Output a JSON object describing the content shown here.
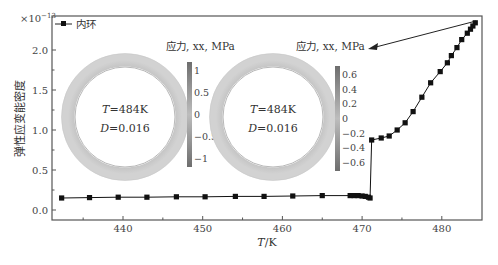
{
  "chart_data": {
    "type": "line",
    "title": "",
    "xlabel": "T/K",
    "ylabel": "弹性应变能密度",
    "y_multiplier": "×10⁻¹³",
    "xlim": [
      431,
      485
    ],
    "ylim": [
      -0.05,
      2.35
    ],
    "xticks": [
      440,
      450,
      460,
      470,
      480
    ],
    "yticks": [
      0.0,
      0.5,
      1.0,
      1.5,
      2.0
    ],
    "xtick_labels": [
      "440",
      "450",
      "460",
      "470",
      "480"
    ],
    "ytick_labels": [
      "0.0",
      "0.5",
      "1.0",
      "1.5",
      "2.0"
    ],
    "grid": false,
    "legend_position": "upper-left",
    "series": [
      {
        "name": "内环",
        "marker": "square",
        "color": "#111111",
        "x": [
          432.3,
          435.8,
          439.4,
          443.0,
          446.7,
          450.3,
          454.1,
          457.7,
          461.3,
          465.0,
          468.5,
          469.0,
          469.5,
          470.0,
          470.4,
          470.8,
          471.0,
          471.2,
          472.4,
          473.4,
          474.4,
          475.4,
          476.4,
          477.5,
          478.6,
          479.8,
          480.7,
          481.2,
          481.9,
          482.5,
          483.2,
          483.6,
          483.9,
          484.2
        ],
        "y": [
          0.15,
          0.155,
          0.16,
          0.16,
          0.165,
          0.165,
          0.17,
          0.17,
          0.175,
          0.18,
          0.18,
          0.18,
          0.18,
          0.175,
          0.17,
          0.16,
          0.15,
          0.875,
          0.9,
          0.925,
          1.0,
          1.09,
          1.23,
          1.41,
          1.59,
          1.73,
          1.84,
          1.93,
          2.03,
          2.13,
          2.21,
          2.26,
          2.3,
          2.34
        ]
      }
    ],
    "annotations": [
      {
        "text": "应力, xx, MPa",
        "arrow_from": [
          484.2,
          2.34
        ],
        "arrow_to": "right-inset-colorbar-title"
      }
    ],
    "insets": [
      {
        "name": "left-ring",
        "colorbar_title": "应力, xx, MPa",
        "colorbar_ticks": [
          "1",
          "0.5",
          "0",
          "−0.5",
          "−1"
        ],
        "temperature_label": "T = 484K",
        "damage_label": "D = 0.016"
      },
      {
        "name": "right-ring",
        "colorbar_title": "应力, xx, MPa",
        "colorbar_ticks": [
          "0.6",
          "0.4",
          "0.2",
          "0",
          "−0.2",
          "−0.4",
          "−0.6"
        ],
        "temperature_label": "T = 484K",
        "damage_label": "D = 0.016"
      }
    ]
  },
  "axes": {
    "xlabel_italic": "T",
    "xlabel_rest": "/K",
    "ylabel": "弹性应变能密度",
    "multiplier": "×10",
    "multiplier_exp": "−13"
  },
  "legend": {
    "label": "内环"
  },
  "insets": {
    "left": {
      "title": "应力, xx, MPa",
      "t_var": "T",
      "t_val": "=484K",
      "d_var": "D",
      "d_val": "=0.016",
      "ticks": [
        "1",
        "0.5",
        "0",
        "−0.5",
        "−1"
      ]
    },
    "right": {
      "title": "应力, xx, MPa",
      "t_var": "T",
      "t_val": "=484K",
      "d_var": "D",
      "d_val": "=0.016",
      "ticks": [
        "0.6",
        "0.4",
        "0.2",
        "0",
        "−0.2",
        "−0.4",
        "−0.6"
      ]
    }
  }
}
